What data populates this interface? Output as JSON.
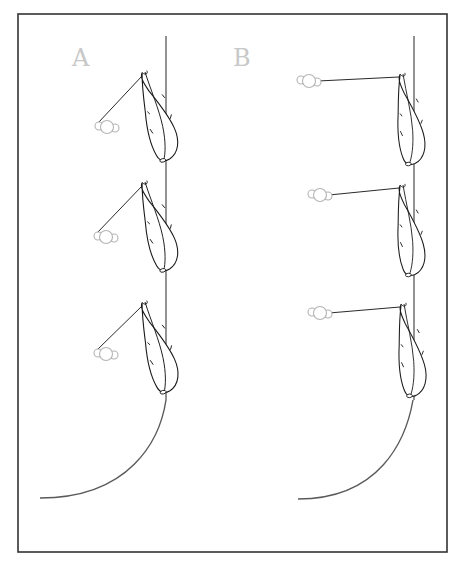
{
  "figure": {
    "frame": {
      "x": 18,
      "y": 14,
      "width": 429,
      "height": 538
    },
    "colors": {
      "frame": "#333333",
      "label": "#c8c8c8",
      "bead": "#b4b4b4",
      "arc": "#5a5a5a",
      "ink": "#1a1a1a"
    },
    "panels": [
      {
        "id": "A",
        "label": "A",
        "label_pos": {
          "x": 72,
          "y": 66
        },
        "vertical_line": {
          "x": 166,
          "y1": 36,
          "y2": 400
        },
        "arc": {
          "start": {
            "x": 166,
            "y": 400
          },
          "end": {
            "x": 40,
            "y": 498
          }
        },
        "feather_attachment": "angled",
        "units": [
          {
            "feather_tip": {
              "x": 143,
              "y": 74
            },
            "feather_base": {
              "x": 166,
              "y": 162
            },
            "bead": {
              "x": 107,
              "y": 127
            }
          },
          {
            "feather_tip": {
              "x": 143,
              "y": 184
            },
            "feather_base": {
              "x": 166,
              "y": 271
            },
            "bead": {
              "x": 106,
              "y": 237
            }
          },
          {
            "feather_tip": {
              "x": 143,
              "y": 304
            },
            "feather_base": {
              "x": 166,
              "y": 395
            },
            "bead": {
              "x": 106,
              "y": 354
            }
          }
        ]
      },
      {
        "id": "B",
        "label": "B",
        "label_pos": {
          "x": 233,
          "y": 66
        },
        "vertical_line": {
          "x": 414,
          "y1": 36,
          "y2": 400
        },
        "arc": {
          "start": {
            "x": 414,
            "y": 400
          },
          "end": {
            "x": 298,
            "y": 499
          }
        },
        "feather_attachment": "horizontal",
        "units": [
          {
            "feather_tip": {
              "x": 402,
              "y": 76
            },
            "feather_base": {
              "x": 412,
              "y": 165
            },
            "bead": {
              "x": 309,
              "y": 81
            }
          },
          {
            "feather_tip": {
              "x": 402,
              "y": 187
            },
            "feather_base": {
              "x": 412,
              "y": 276
            },
            "bead": {
              "x": 320,
              "y": 195
            }
          },
          {
            "feather_tip": {
              "x": 403,
              "y": 306
            },
            "feather_base": {
              "x": 413,
              "y": 397
            },
            "bead": {
              "x": 320,
              "y": 313
            }
          }
        ]
      }
    ]
  }
}
